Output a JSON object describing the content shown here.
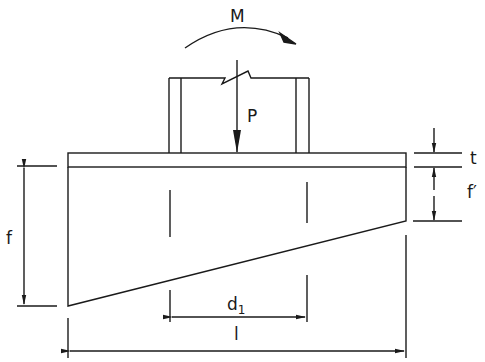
{
  "diagram": {
    "type": "base-plate-loading-sketch",
    "line_color": "#1a1a1a",
    "background": "#ffffff",
    "labels": {
      "moment": "M",
      "axial_load": "P",
      "plate_thickness": "t",
      "depth_total": "f",
      "depth_edge": "f′",
      "column_spacing_main": "d",
      "column_spacing_sub": "1",
      "length": "l"
    }
  }
}
